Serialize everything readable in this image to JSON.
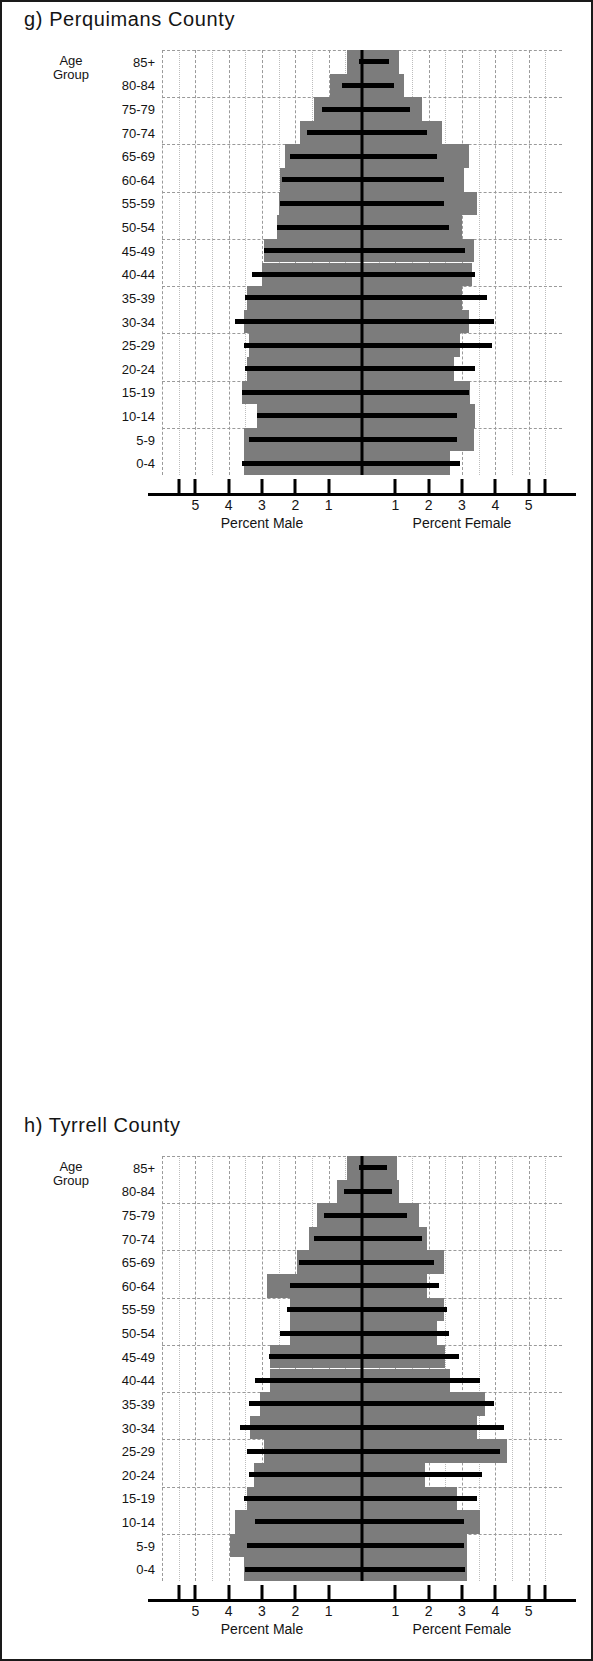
{
  "figure": {
    "background": "#ffffff",
    "border_color": "#1a1a1a",
    "bar_color": "#7c7c7c",
    "reference_color": "#000000",
    "grid_color": "#9a9a9a"
  },
  "common": {
    "age_group_label_line1": "Age",
    "age_group_label_line2": "Group",
    "male_caption": "Percent Male",
    "female_caption": "Percent Female",
    "tick_labels_left": [
      "5",
      "4",
      "3",
      "2",
      "1"
    ],
    "tick_labels_right": [
      "1",
      "2",
      "3",
      "4",
      "5"
    ],
    "age_groups": [
      "85+",
      "80-84",
      "75-79",
      "70-74",
      "65-69",
      "60-64",
      "55-59",
      "50-54",
      "45-49",
      "40-44",
      "35-39",
      "30-34",
      "25-29",
      "20-24",
      "15-19",
      "10-14",
      "5-9",
      "0-4"
    ]
  },
  "panels": [
    {
      "id": "perquimans",
      "title": "g) Perquimans County"
    },
    {
      "id": "tyrrell",
      "title": "h) Tyrrell County"
    },
    {
      "id": "washington",
      "title": "i) Washington County"
    }
  ],
  "chart_data": [
    {
      "type": "bar",
      "subplot": "g",
      "title": "g) Perquimans County",
      "orientation": "horizontal-pyramid",
      "xlabel_left": "Percent Male",
      "xlabel_right": "Percent Female",
      "ylabel": "Age Group",
      "xlim": [
        -6,
        6
      ],
      "xticks": [
        -5,
        -4,
        -3,
        -2,
        -1,
        1,
        2,
        3,
        4,
        5
      ],
      "xticklabels": [
        "5",
        "4",
        "3",
        "2",
        "1",
        "1",
        "2",
        "3",
        "4",
        "5"
      ],
      "grid": true,
      "legend": "none",
      "categories": [
        "85+",
        "80-84",
        "75-79",
        "70-74",
        "65-69",
        "60-64",
        "55-59",
        "50-54",
        "45-49",
        "40-44",
        "35-39",
        "30-34",
        "25-29",
        "20-24",
        "15-19",
        "10-14",
        "5-9",
        "0-4"
      ],
      "series": [
        {
          "name": "Male (county, bar)",
          "values": [
            0.45,
            0.95,
            1.45,
            1.85,
            2.3,
            2.45,
            2.5,
            2.55,
            2.95,
            3.0,
            3.45,
            3.55,
            3.4,
            3.45,
            3.6,
            3.15,
            3.55,
            3.55
          ]
        },
        {
          "name": "Female (county, bar)",
          "values": [
            1.1,
            1.25,
            1.8,
            2.4,
            3.2,
            3.05,
            3.45,
            3.0,
            3.35,
            3.3,
            3.0,
            3.2,
            2.95,
            2.75,
            3.25,
            3.4,
            3.35,
            2.65
          ]
        },
        {
          "name": "Male (reference, line)",
          "values": [
            0.1,
            0.6,
            1.2,
            1.65,
            2.15,
            2.4,
            2.45,
            2.55,
            2.95,
            3.3,
            3.5,
            3.8,
            3.55,
            3.5,
            3.6,
            3.15,
            3.4,
            3.6
          ]
        },
        {
          "name": "Female (reference, line)",
          "values": [
            0.8,
            0.95,
            1.45,
            1.95,
            2.25,
            2.45,
            2.45,
            2.6,
            3.1,
            3.4,
            3.75,
            3.95,
            3.9,
            3.4,
            3.2,
            2.85,
            2.85,
            2.95
          ]
        }
      ]
    },
    {
      "type": "bar",
      "subplot": "h",
      "title": "h) Tyrrell County",
      "orientation": "horizontal-pyramid",
      "xlabel_left": "Percent Male",
      "xlabel_right": "Percent Female",
      "ylabel": "Age Group",
      "xlim": [
        -6,
        6
      ],
      "xticks": [
        -5,
        -4,
        -3,
        -2,
        -1,
        1,
        2,
        3,
        4,
        5
      ],
      "xticklabels": [
        "5",
        "4",
        "3",
        "2",
        "1",
        "1",
        "2",
        "3",
        "4",
        "5"
      ],
      "grid": true,
      "legend": "none",
      "categories": [
        "85+",
        "80-84",
        "75-79",
        "70-74",
        "65-69",
        "60-64",
        "55-59",
        "50-54",
        "45-49",
        "40-44",
        "35-39",
        "30-34",
        "25-29",
        "20-24",
        "15-19",
        "10-14",
        "5-9",
        "0-4"
      ],
      "series": [
        {
          "name": "Male (county, bar)",
          "values": [
            0.45,
            0.75,
            1.35,
            1.6,
            1.95,
            2.85,
            2.15,
            2.15,
            2.75,
            2.75,
            3.05,
            3.35,
            2.95,
            3.25,
            3.45,
            3.8,
            3.95,
            3.55
          ]
        },
        {
          "name": "Female (county, bar)",
          "values": [
            1.05,
            1.1,
            1.7,
            1.95,
            2.45,
            1.95,
            2.45,
            2.25,
            2.5,
            2.65,
            3.7,
            3.45,
            4.35,
            1.9,
            2.85,
            3.55,
            3.15,
            3.15
          ]
        },
        {
          "name": "Male (reference, line)",
          "values": [
            0.1,
            0.55,
            1.15,
            1.45,
            1.9,
            2.15,
            2.25,
            2.45,
            2.8,
            3.2,
            3.4,
            3.65,
            3.45,
            3.4,
            3.55,
            3.2,
            3.45,
            3.5
          ]
        },
        {
          "name": "Female (reference, line)",
          "values": [
            0.75,
            0.9,
            1.35,
            1.8,
            2.15,
            2.3,
            2.55,
            2.6,
            2.9,
            3.55,
            3.95,
            4.25,
            4.15,
            3.6,
            3.45,
            3.05,
            3.05,
            3.1
          ]
        }
      ]
    },
    {
      "type": "bar",
      "subplot": "i",
      "title": "i) Washington County",
      "orientation": "horizontal-pyramid",
      "xlabel_left": "Percent Male",
      "xlabel_right": "Percent Female",
      "ylabel": "Age Group",
      "xlim": [
        -6,
        6
      ],
      "xticks": [
        -5,
        -4,
        -3,
        -2,
        -1,
        1,
        2,
        3,
        4,
        5
      ],
      "xticklabels": [
        "5",
        "4",
        "3",
        "2",
        "1",
        "1",
        "2",
        "3",
        "4",
        "5"
      ],
      "grid": true,
      "legend": "none",
      "categories": [
        "85+",
        "80-84",
        "75-79",
        "70-74",
        "65-69",
        "60-64",
        "55-59",
        "50-54",
        "45-49",
        "40-44",
        "35-39",
        "30-34",
        "25-29",
        "20-24",
        "15-19",
        "10-14",
        "5-9",
        "0-4"
      ],
      "series": [
        {
          "name": "Male (county, bar)",
          "values": [
            0.4,
            0.85,
            1.55,
            1.95,
            2.35,
            2.5,
            2.65,
            2.85,
            3.05,
            3.5,
            3.6,
            3.45,
            3.25,
            3.4,
            3.6,
            3.55,
            3.75,
            3.6
          ]
        },
        {
          "name": "Female (county, bar)",
          "values": [
            0.85,
            1.15,
            1.6,
            2.1,
            2.85,
            2.5,
            2.55,
            2.85,
            3.15,
            3.35,
            3.75,
            3.15,
            3.75,
            3.05,
            3.45,
            3.75,
            3.45,
            3.35
          ]
        },
        {
          "name": "Male (reference, line)",
          "values": [
            0.1,
            0.6,
            1.2,
            1.65,
            2.15,
            2.4,
            2.5,
            2.7,
            2.95,
            3.4,
            3.55,
            3.7,
            3.5,
            3.5,
            3.45,
            3.25,
            3.45,
            3.55
          ]
        },
        {
          "name": "Female (reference, line)",
          "values": [
            0.8,
            1.0,
            1.45,
            1.95,
            2.25,
            2.45,
            2.5,
            2.65,
            3.05,
            3.45,
            3.85,
            4.05,
            3.95,
            3.55,
            3.4,
            3.1,
            3.1,
            3.15
          ]
        }
      ]
    }
  ]
}
